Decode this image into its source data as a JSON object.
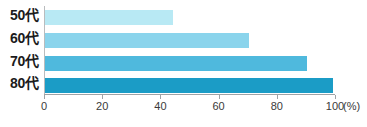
{
  "chart_data": {
    "type": "bar",
    "orientation": "horizontal",
    "title": "",
    "subtitle": "",
    "xlabel": "(%)",
    "ylabel": "",
    "categories": [
      "50代",
      "60代",
      "70代",
      "80代"
    ],
    "values": [
      44,
      70,
      90,
      99
    ],
    "series": [
      {
        "name": "",
        "values": [
          44,
          70,
          90,
          99
        ]
      }
    ],
    "xlim": [
      0,
      100
    ],
    "xticks": [
      0,
      20,
      40,
      60,
      80,
      100
    ],
    "xtick_labels": [
      "0",
      "20",
      "40",
      "60",
      "80",
      "100"
    ],
    "grid": false,
    "legend": false,
    "legend_position": "none",
    "bar_colors": [
      "#b8e9f4",
      "#8ad4ec",
      "#4fb9dd",
      "#1b9cc6"
    ],
    "axis_color": "#9fa3a6",
    "label_color": "#1b1b1b",
    "background": "#ffffff",
    "unit_label": "(%)",
    "annotations": []
  }
}
